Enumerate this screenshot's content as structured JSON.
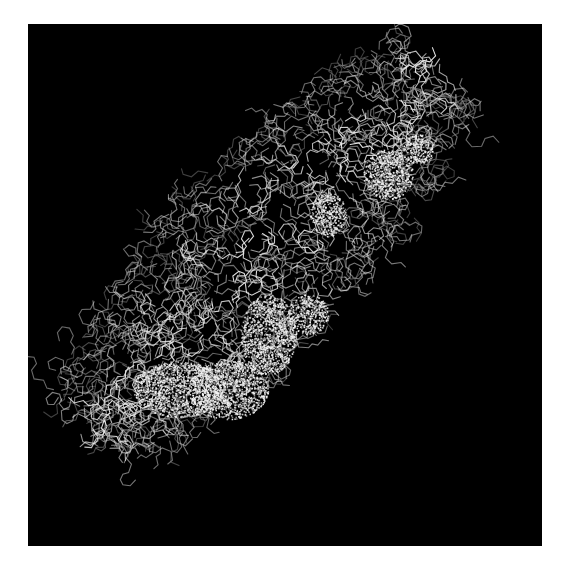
{
  "figure": {
    "background_color": "#000000",
    "page_color": "#ffffff",
    "bond_color": "#e8e8e8",
    "bond_dim_color": "#8a8a8a",
    "surface_color": "#f4f4f4",
    "viewport": {
      "x": 28,
      "y": 24,
      "width": 514,
      "height": 522
    },
    "band": {
      "description": "elongated molecule running from lower-left to upper-right",
      "start": [
        90,
        430
      ],
      "end": [
        440,
        70
      ],
      "width": 200
    },
    "surface_clusters": [
      {
        "cx": 150,
        "cy": 365,
        "rx": 45,
        "ry": 28
      },
      {
        "cx": 200,
        "cy": 365,
        "rx": 40,
        "ry": 30
      },
      {
        "cx": 240,
        "cy": 310,
        "rx": 28,
        "ry": 40
      },
      {
        "cx": 280,
        "cy": 290,
        "rx": 20,
        "ry": 20
      },
      {
        "cx": 300,
        "cy": 190,
        "rx": 18,
        "ry": 22
      },
      {
        "cx": 360,
        "cy": 150,
        "rx": 25,
        "ry": 25
      },
      {
        "cx": 390,
        "cy": 125,
        "rx": 15,
        "ry": 15
      }
    ]
  }
}
